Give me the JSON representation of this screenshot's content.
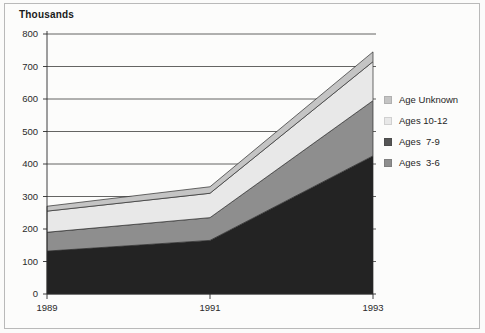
{
  "chart_data": {
    "type": "area",
    "title": "Thousands",
    "xlabel": "",
    "ylabel": "Thousands",
    "stacked": true,
    "grid": true,
    "legend_position": "right",
    "x": [
      1989,
      1991,
      1993
    ],
    "categories": [
      "1989",
      "1991",
      "1993"
    ],
    "xtick_labels": [
      "1989",
      "1991",
      "1993"
    ],
    "ytick_labels": [
      "0",
      "100",
      "200",
      "300",
      "400",
      "500",
      "600",
      "700",
      "800"
    ],
    "ytick_values": [
      0,
      100,
      200,
      300,
      400,
      500,
      600,
      700,
      800
    ],
    "ylim": [
      0,
      800
    ],
    "series": [
      {
        "name": "Ages  3-6",
        "values": [
          132,
          165,
          425
        ],
        "color": "#232323"
      },
      {
        "name": "Ages  7-9",
        "values": [
          58,
          70,
          170
        ],
        "color": "#8e8e8e"
      },
      {
        "name": "Ages 10-12",
        "values": [
          65,
          75,
          120
        ],
        "color": "#e8e8e8"
      },
      {
        "name": "Age Unknown",
        "values": [
          15,
          20,
          30
        ],
        "color": "#c4c4c4"
      }
    ],
    "cumulative_tops": {
      "Ages  3-6": [
        132,
        165,
        425
      ],
      "Ages  7-9": [
        190,
        235,
        595
      ],
      "Ages 10-12": [
        255,
        310,
        715
      ],
      "Age Unknown": [
        270,
        330,
        745
      ]
    }
  },
  "legend": {
    "items": [
      {
        "label": "Age Unknown",
        "color": "#c4c4c4"
      },
      {
        "label": "Ages 10-12",
        "color": "#e8e8e8"
      },
      {
        "label": "Ages  7-9",
        "color": "#555555"
      },
      {
        "label": "Ages  3-6",
        "color": "#8e8e8e"
      }
    ]
  }
}
